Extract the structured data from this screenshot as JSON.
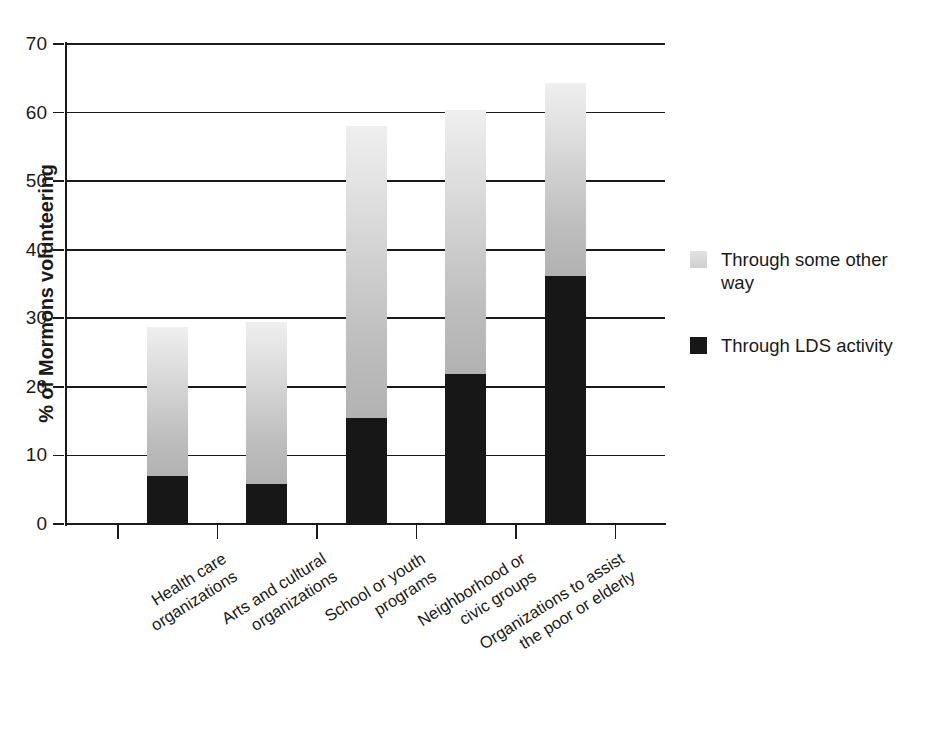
{
  "chart_data": {
    "type": "bar",
    "subtype": "stacked-vertical",
    "title": "",
    "subtitle": "",
    "xlabel": "",
    "ylabel": "% of Mormons volunteering",
    "ylim": [
      0,
      70
    ],
    "ytick_step": 10,
    "ytick_labels": [
      "70",
      "60",
      "50",
      "40",
      "30",
      "20",
      "10",
      "0"
    ],
    "ytick_values": [
      70,
      60,
      50,
      40,
      30,
      20,
      10,
      0
    ],
    "grid": true,
    "grid_axis": "y",
    "legend_position": "right",
    "categories": [
      "Health care organizations",
      "Arts and cultural organizations",
      "School or youth programs",
      "Neighborhood or civic groups",
      "Organizations to assist the poor or elderly"
    ],
    "category_lines": [
      [
        "Health care",
        "organizations"
      ],
      [
        "Arts and cultural",
        "organizations"
      ],
      [
        "School or youth",
        "programs"
      ],
      [
        "Neighborhood or",
        "civic groups"
      ],
      [
        "Organizations to assist",
        "the poor or elderly"
      ]
    ],
    "series": [
      {
        "name": "Through LDS activity",
        "color": "#171717",
        "values": [
          7.0,
          5.8,
          15.4,
          21.9,
          36.1
        ]
      },
      {
        "name": "Through some other way",
        "color": "#cfcfcf",
        "values": [
          21.8,
          23.7,
          42.6,
          38.5,
          28.2
        ]
      }
    ],
    "totals": [
      28.8,
      29.5,
      58.0,
      60.4,
      64.3
    ],
    "stack_order_bottom_to_top": [
      "Through LDS activity",
      "Through some other way"
    ]
  },
  "legend": {
    "items": [
      {
        "label_line1": "Through some other",
        "label_line2": "way",
        "label": "Through some other way",
        "swatch": "other"
      },
      {
        "label_line1": "Through LDS activity",
        "label_line2": "",
        "label": "Through LDS activity",
        "swatch": "lds"
      }
    ]
  },
  "axis": {
    "y_title": "% of Mormons volunteering"
  },
  "colors": {
    "ink": "#1a1a1a",
    "lds": "#171717",
    "other_light": "#efefef",
    "other_dark": "#b2b2b2",
    "background": "#ffffff"
  }
}
